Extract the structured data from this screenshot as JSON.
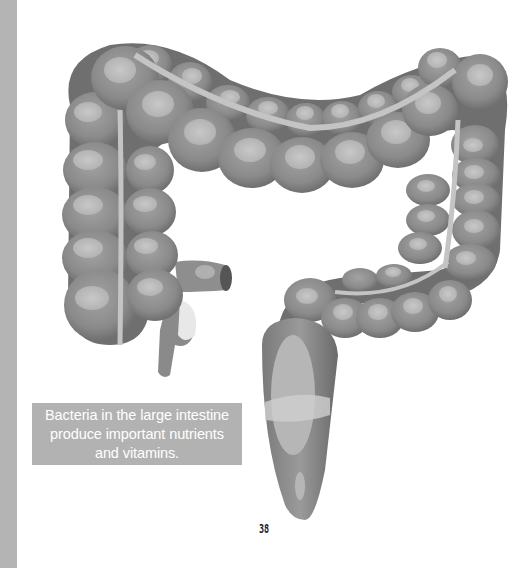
{
  "page": {
    "caption": {
      "line1": "Bacteria in the large intestine",
      "line2": "produce important nutrients",
      "line3": "and vitamins."
    },
    "page_number": "38",
    "illustration": {
      "subject": "large-intestine-illustration",
      "parts": [
        "ascending-colon",
        "transverse-colon",
        "descending-colon",
        "sigmoid-colon",
        "rectum",
        "appendix",
        "ileum"
      ]
    },
    "colors": {
      "side_strip": "#b4b4b4",
      "caption_bg": "#b2b2b2",
      "caption_text": "#ffffff",
      "organ_dark": "#6e6e6e",
      "organ_mid": "#8c8c8c",
      "organ_light": "#b9b9b9",
      "taenia_band": "#c4c4c4"
    }
  }
}
